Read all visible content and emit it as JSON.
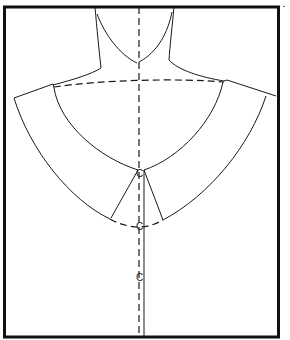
{
  "diagram": {
    "colors": {
      "ink": "#1a1a1a",
      "frame": "#111111",
      "background": "#ffffff"
    },
    "elements": [
      {
        "name": "frame",
        "type": "rectangle"
      },
      {
        "name": "neck-outline",
        "type": "curve"
      },
      {
        "name": "center-front-line",
        "type": "dashed-line"
      },
      {
        "name": "shoulder-guide-line",
        "type": "dashed-curve"
      },
      {
        "name": "collar-neckline-edge",
        "type": "curve"
      },
      {
        "name": "collar-outer-edge",
        "type": "curve"
      },
      {
        "name": "front-opening-lines",
        "type": "lines"
      },
      {
        "name": "collar-hem-dashed-arc",
        "type": "dashed-curve"
      },
      {
        "name": "extension-line",
        "type": "line"
      }
    ],
    "notches": [
      {
        "label": "C",
        "x": 136,
        "y": 177
      },
      {
        "label": "C",
        "x": 136,
        "y": 230
      },
      {
        "label": "C",
        "x": 136,
        "y": 281
      }
    ]
  }
}
